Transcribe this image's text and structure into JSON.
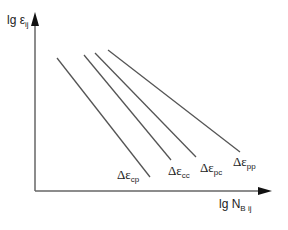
{
  "diagram": {
    "type": "log-log fatigue strain-life diagram",
    "y_axis": {
      "label_main": "lg ε",
      "label_sub": "ij"
    },
    "x_axis": {
      "label_main": "lg N",
      "label_sub": "B ij"
    },
    "curves": [
      {
        "id": "cp",
        "label_main": "Δε",
        "label_sub": "cp",
        "x1": 57,
        "y1": 58,
        "x2": 150,
        "y2": 177
      },
      {
        "id": "cc",
        "label_main": "Δε",
        "label_sub": "cc",
        "x1": 84,
        "y1": 55,
        "x2": 171,
        "y2": 160
      },
      {
        "id": "pc",
        "label_main": "Δε",
        "label_sub": "pc",
        "x1": 95,
        "y1": 53,
        "x2": 196,
        "y2": 157
      },
      {
        "id": "pp",
        "label_main": "Δε",
        "label_sub": "pp",
        "x1": 108,
        "y1": 50,
        "x2": 240,
        "y2": 152
      }
    ],
    "colors": {
      "axis": "#555555",
      "line": "#555555",
      "text": "#222222"
    }
  }
}
